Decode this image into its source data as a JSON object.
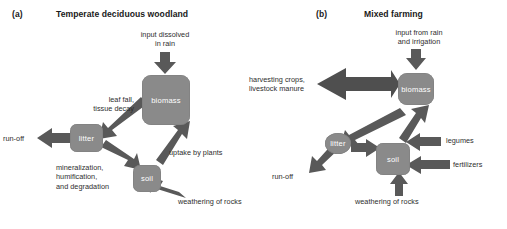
{
  "figure": {
    "panels": [
      {
        "letter": "(a)",
        "title": "Temperate deciduous woodland",
        "nodes": [
          {
            "id": "biomass",
            "label": "biomass"
          },
          {
            "id": "litter",
            "label": "litter"
          },
          {
            "id": "soil",
            "label": "soil"
          }
        ],
        "flow_labels": [
          {
            "id": "input-rain",
            "text": "input dissolved\nin rain"
          },
          {
            "id": "leaf-fall",
            "text": "leaf fall,\ntissue decay"
          },
          {
            "id": "run-off",
            "text": "run-off"
          },
          {
            "id": "mineralization",
            "text": "mineralization,\nhumification,\nand degradation"
          },
          {
            "id": "uptake",
            "text": "uptake by plants"
          },
          {
            "id": "weathering",
            "text": "weathering of rocks"
          }
        ]
      },
      {
        "letter": "(b)",
        "title": "Mixed farming",
        "nodes": [
          {
            "id": "biomass",
            "label": "biomass"
          },
          {
            "id": "litter",
            "label": "litter"
          },
          {
            "id": "soil",
            "label": "soil"
          }
        ],
        "flow_labels": [
          {
            "id": "input-rain-irrigation",
            "text": "input from rain\nand irrigation"
          },
          {
            "id": "harvesting",
            "text": "harvesting crops,\nlivestock manure"
          },
          {
            "id": "run-off",
            "text": "run-off"
          },
          {
            "id": "legumes",
            "text": "legumes"
          },
          {
            "id": "fertilizers",
            "text": "fertilizers"
          },
          {
            "id": "weathering",
            "text": "weathering of rocks"
          }
        ]
      }
    ],
    "colors": {
      "node_fill": "#8a8a8a",
      "arrow_fill": "#595959",
      "text": "#2e2e2e",
      "background": "#ffffff"
    }
  }
}
